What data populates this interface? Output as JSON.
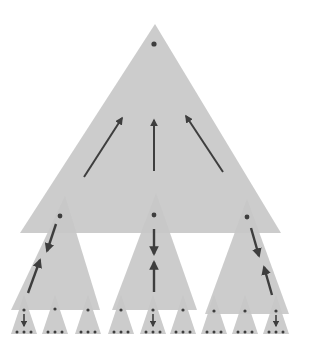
{
  "diagram": {
    "title": "",
    "colors": {
      "background": "#ffffff",
      "triangle_fill": "#c8c8c8",
      "arrow": "#3e3e3e",
      "dot": "#3e3e3e"
    },
    "root": {
      "apex": [
        155,
        24
      ],
      "base_y": 233,
      "base_left": 20,
      "base_right": 281,
      "dot": [
        154,
        44
      ],
      "arrows": [
        {
          "from": [
            84,
            177
          ],
          "to": [
            122,
            118
          ],
          "direction": "up"
        },
        {
          "from": [
            154,
            171
          ],
          "to": [
            154,
            120
          ],
          "direction": "up"
        },
        {
          "from": [
            223,
            172
          ],
          "to": [
            186,
            116
          ],
          "direction": "up"
        }
      ]
    },
    "children": [
      {
        "apex": [
          65,
          196
        ],
        "base_y": 310,
        "base_left": 11,
        "base_right": 100,
        "dot": [
          60,
          216
        ],
        "arrows": [
          {
            "from": [
              56,
              224
            ],
            "to": [
              47,
              251
            ],
            "direction": "down"
          },
          {
            "from": [
              28,
              293
            ],
            "to": [
              40,
              260
            ],
            "direction": "up"
          }
        ]
      },
      {
        "apex": [
          156,
          193
        ],
        "base_y": 310,
        "base_left": 112,
        "base_right": 197,
        "dot": [
          154,
          215
        ],
        "arrows": [
          {
            "from": [
              154,
              229
            ],
            "to": [
              154,
              254
            ],
            "direction": "down"
          },
          {
            "from": [
              154,
              292
            ],
            "to": [
              154,
              262
            ],
            "direction": "up"
          }
        ]
      },
      {
        "apex": [
          247,
          199
        ],
        "base_y": 314,
        "base_left": 205,
        "base_right": 289,
        "dot": [
          247,
          217
        ],
        "arrows": [
          {
            "from": [
              251,
              228
            ],
            "to": [
              259,
              256
            ],
            "direction": "down"
          },
          {
            "from": [
              272,
              295
            ],
            "to": [
              264,
              267
            ],
            "direction": "up"
          }
        ]
      }
    ],
    "leaves": [
      {
        "cx": 24,
        "dot_y": 310,
        "arrow_down": true
      },
      {
        "cx": 55,
        "dot_y": 309,
        "arrow_down": false
      },
      {
        "cx": 88,
        "dot_y": 310,
        "arrow_down": false
      },
      {
        "cx": 121,
        "dot_y": 310,
        "arrow_down": false
      },
      {
        "cx": 153,
        "dot_y": 310,
        "arrow_down": true
      },
      {
        "cx": 183,
        "dot_y": 310,
        "arrow_down": false
      },
      {
        "cx": 214,
        "dot_y": 311,
        "arrow_down": false
      },
      {
        "cx": 245,
        "dot_y": 311,
        "arrow_down": false
      },
      {
        "cx": 276,
        "dot_y": 311,
        "arrow_down": true
      }
    ],
    "leaf_shape": {
      "apex_y": 295,
      "base_y": 334,
      "half_width": 13,
      "bottom_dot_y": 332,
      "bottom_dot_spacing": 7
    }
  }
}
